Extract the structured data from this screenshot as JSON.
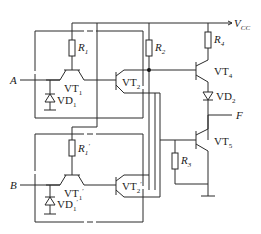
{
  "diagram": {
    "type": "circuit",
    "title": "",
    "supply": {
      "label": "V",
      "sub": "CC"
    },
    "inputs": [
      {
        "id": "A",
        "label": "A"
      },
      {
        "id": "B",
        "label": "B"
      }
    ],
    "output": {
      "label": "F"
    },
    "components": {
      "R1": {
        "label": "R",
        "sub": "1"
      },
      "R1p": {
        "label": "R",
        "sub": "1",
        "prime": "′"
      },
      "R2": {
        "label": "R",
        "sub": "2"
      },
      "R3": {
        "label": "R",
        "sub": "3"
      },
      "R4": {
        "label": "R",
        "sub": "4"
      },
      "VT1": {
        "label": "VT",
        "sub": "1"
      },
      "VT1p": {
        "label": "VT",
        "sub": "1",
        "prime": "′"
      },
      "VT2": {
        "label": "VT",
        "sub": "2"
      },
      "VT2p": {
        "label": "VT",
        "sub": "2",
        "prime": "′"
      },
      "VT4": {
        "label": "VT",
        "sub": "4"
      },
      "VT5": {
        "label": "VT",
        "sub": "5"
      },
      "VD1": {
        "label": "VD",
        "sub": "1"
      },
      "VD1p": {
        "label": "VD",
        "sub": "1",
        "prime": "′"
      },
      "VD2": {
        "label": "VD",
        "sub": "2"
      }
    }
  }
}
